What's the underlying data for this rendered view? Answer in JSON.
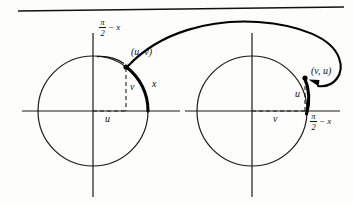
{
  "figure": {
    "background_color": "#fdfdfc",
    "ink_color": "#111111",
    "top_rule": {
      "name": "top-horizontal-rule",
      "x1": 18,
      "y1": 11,
      "x2": 344,
      "y2": 7
    }
  },
  "left_panel": {
    "name": "left-unit-circle-panel",
    "circle": {
      "cx": 93,
      "cy": 111,
      "r": 55
    },
    "x_axis": {
      "x1": 22,
      "y1": 111,
      "x2": 180,
      "y2": 111
    },
    "y_axis": {
      "x1": 93,
      "y1": 33,
      "x2": 93,
      "y2": 197
    },
    "point": {
      "cx": 126,
      "cy": 67,
      "label": "(u, v)",
      "label_x": 131,
      "label_y": 52
    },
    "arc_label": {
      "text": "x",
      "x": 153,
      "y": 84
    },
    "angle_label": {
      "numerator": "π",
      "denominator": "2",
      "rest": "− x",
      "x": 99,
      "y": 19
    },
    "v_label": {
      "text": "v",
      "x": 131,
      "y": 85
    },
    "u_label": {
      "text": "u",
      "x": 106,
      "y": 116
    },
    "dashed_vertical": {
      "x": 126,
      "y1": 67,
      "y2": 111
    },
    "dashed_horizontal": {
      "y": 111,
      "x1": 93,
      "x2": 126
    },
    "thick_arc_desc": "bold arc on circle from 3 o'clock up to point (u, v)"
  },
  "right_panel": {
    "name": "right-unit-circle-panel",
    "circle": {
      "cx": 252,
      "cy": 111,
      "r": 55
    },
    "x_axis": {
      "x1": 185,
      "y1": 111,
      "x2": 340,
      "y2": 111
    },
    "y_axis": {
      "x1": 252,
      "y1": 33,
      "x2": 252,
      "y2": 197
    },
    "point": {
      "cx": 305,
      "cy": 78,
      "label": "(v, u)",
      "label_x": 310,
      "label_y": 72
    },
    "angle_label": {
      "numerator": "π",
      "denominator": "2",
      "rest": "− x",
      "x": 311,
      "y": 113
    },
    "u_label": {
      "text": "u",
      "x": 296,
      "y": 93
    },
    "v_label": {
      "text": "v",
      "x": 274,
      "y": 116
    },
    "dashed_vertical": {
      "x": 305,
      "y1": 78,
      "y2": 111
    },
    "dashed_horizontal": {
      "y": 111,
      "x1": 252,
      "x2": 305
    },
    "thick_arc_desc": "bold arc on circle from 3 o'clock up to point (v, u)"
  },
  "mapping_arrow": {
    "name": "mapping-arrow-curve",
    "description": "sweeping curve from point (u, v) on the left circle, arcing over both circles, looping right and ending with an arrowhead at point (v, u) on the right circle",
    "arrowhead_at": {
      "x": 314,
      "y": 83
    }
  }
}
